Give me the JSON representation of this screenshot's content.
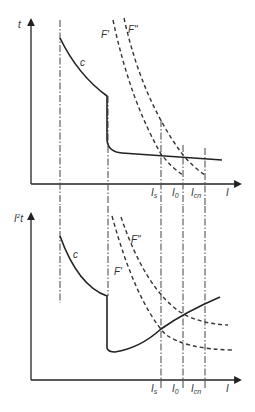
{
  "diagram": {
    "top_chart": {
      "y_axis_label": "t",
      "x_axis_label": "I",
      "curve_label": "c",
      "fuse_labels": [
        "F'",
        "F\""
      ],
      "current_markers": [
        "I",
        "s",
        "I",
        "0",
        "I",
        "cn"
      ]
    },
    "bottom_chart": {
      "y_axis_label_base": "I",
      "y_axis_label_sup": "2",
      "y_axis_label_tail": "t",
      "x_axis_label": "I",
      "curve_label": "c",
      "fuse_labels": [
        "F'",
        "F\""
      ],
      "current_markers": [
        "I",
        "s",
        "I",
        "0",
        "I",
        "cn"
      ]
    },
    "colors": {
      "line": "#222222",
      "background": "#ffffff"
    }
  }
}
